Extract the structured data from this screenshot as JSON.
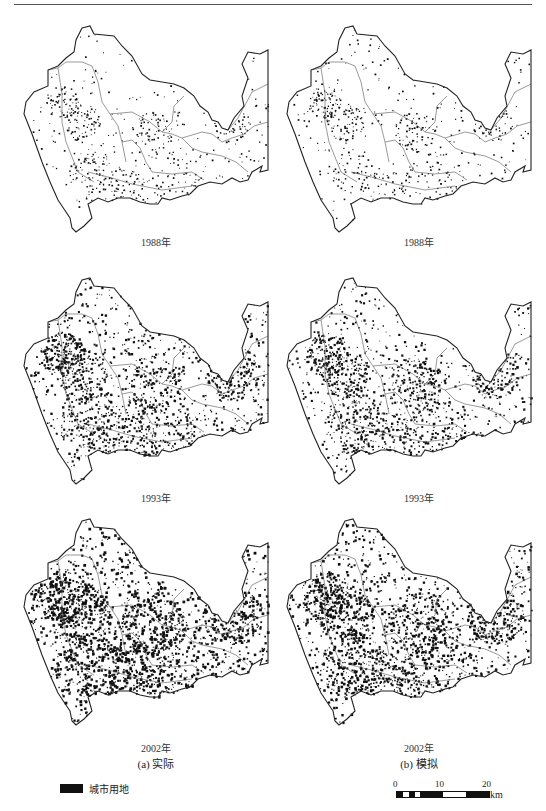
{
  "header": {
    "rule": true
  },
  "panels": [
    {
      "id": "a-1988",
      "column": "left",
      "year_label": "1988年",
      "density": 0.1,
      "seed": 11
    },
    {
      "id": "b-1988",
      "column": "right",
      "year_label": "1988年",
      "density": 0.1,
      "seed": 23
    },
    {
      "id": "a-1993",
      "column": "left",
      "year_label": "1993年",
      "density": 0.38,
      "seed": 37
    },
    {
      "id": "b-1993",
      "column": "right",
      "year_label": "1993年",
      "density": 0.33,
      "seed": 41
    },
    {
      "id": "a-2002",
      "column": "left",
      "year_label": "2002年",
      "density": 0.55,
      "seed": 53
    },
    {
      "id": "b-2002",
      "column": "right",
      "year_label": "2002年",
      "density": 0.48,
      "seed": 67
    }
  ],
  "captions": {
    "left": "(a) 实际",
    "right": "(b) 模拟"
  },
  "legend": {
    "swatch_color": "#111111",
    "label": "城市用地"
  },
  "scale_bar": {
    "ticks": [
      "0",
      "10",
      "20"
    ],
    "unit": "km"
  },
  "colors": {
    "urban_land": "#111111",
    "boundary": "#222222",
    "background": "#ffffff"
  }
}
